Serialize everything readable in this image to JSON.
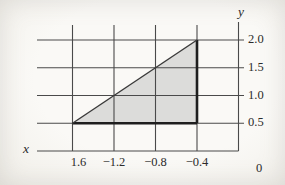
{
  "figure": {
    "xlabel": "x",
    "ylabel": "y"
  },
  "chart_data": {
    "type": "area",
    "xlabel": "x",
    "ylabel": "y",
    "x_tick_labels": [
      "1.6",
      "−1.2",
      "−0.8",
      "−0.4"
    ],
    "x_tick_values": [
      -1.6,
      -1.2,
      -0.8,
      -0.4
    ],
    "origin_label": "0",
    "y_tick_labels": [
      "2.0",
      "1.5",
      "1.0",
      "0.5"
    ],
    "y_tick_values": [
      2.0,
      1.5,
      1.0,
      0.5
    ],
    "xlim": [
      -1.6,
      0
    ],
    "ylim": [
      0,
      2.0
    ],
    "grid": true,
    "region": {
      "shape": "triangle",
      "vertices": [
        [
          -1.6,
          0.5
        ],
        [
          -0.4,
          0.5
        ],
        [
          -0.4,
          2.0
        ]
      ],
      "bold_edges": [
        "bottom",
        "right"
      ],
      "fill": "#dcdcda"
    },
    "colors": {
      "background": "#f7f6f2",
      "grid": "#4a4a4a",
      "text": "#2b2b2b",
      "region_fill": "#dcdcda",
      "region_edge_bold": "#1e1e1e",
      "hypotenuse": "#3a3a3a"
    }
  }
}
